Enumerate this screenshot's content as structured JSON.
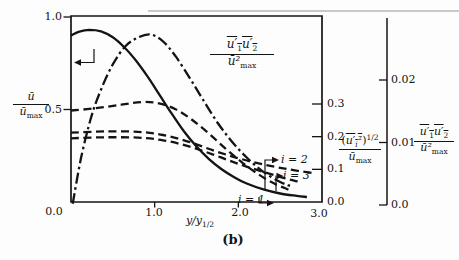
{
  "figure": {
    "caption": "(b)",
    "ink_color": "#141414",
    "background_color": "#fdfdfd",
    "artifact_rule_color": "#c9c9c9"
  },
  "chart_data": {
    "type": "line",
    "title": "",
    "grid": false,
    "x_axis": {
      "label_base": "y/y",
      "label_sub": "1/2",
      "origin_label": "0.0",
      "range": [
        0,
        3
      ],
      "ticks": [
        {
          "label": "1.0",
          "x": 1
        },
        {
          "label": "2.0",
          "x": 2
        },
        {
          "label": "3.0",
          "x": 3
        }
      ]
    },
    "left_axis": {
      "num": "ū",
      "den_base": "ū",
      "den_sub": "max",
      "range": [
        0,
        1
      ],
      "ticks": [
        {
          "label": "1.0",
          "v": 1
        },
        {
          "label": "0.5",
          "v": 0.5
        }
      ]
    },
    "inner_right_axis": {
      "num_open": "(",
      "num_base": "u′",
      "num_sub": "i",
      "num_sup": "²",
      "num_close": ")",
      "num_exp": "1/2",
      "den_base": "ū",
      "den_sub": "max",
      "range": [
        0,
        0.57
      ],
      "ticks": [
        {
          "label": "0.3",
          "v": 0.3
        },
        {
          "label": "0.2",
          "v": 0.2
        },
        {
          "label": "0.1",
          "v": 0.1
        },
        {
          "label": "0.0",
          "v": 0
        }
      ]
    },
    "outer_right_axis": {
      "num_u1": "u′",
      "num_u1_sub": "1",
      "num_u2": "u′",
      "num_u2_sub": "2",
      "den_base": "ū²",
      "den_sub": "max",
      "range": [
        0,
        0.0303
      ],
      "ticks": [
        {
          "label": "0.02",
          "v": 0.02
        },
        {
          "label": "0.01",
          "v": 0.01
        },
        {
          "label": "0.0",
          "v": 0
        }
      ]
    },
    "curve_label": {
      "num_u1": "u′",
      "num_u1_sub": "1",
      "num_u2": "u′",
      "num_u2_sub": "2",
      "den_base": "ū²",
      "den_sub": "max"
    },
    "series_labels": [
      {
        "text": "i = 2"
      },
      {
        "text": "i = 3"
      },
      {
        "text": "i = 1"
      }
    ],
    "caption": "(b)",
    "series": [
      {
        "name": "mean velocity u/u_max",
        "axis": "left",
        "style": "solid",
        "points": [
          [
            0,
            0.9
          ],
          [
            0.1,
            0.921
          ],
          [
            0.22,
            0.93
          ],
          [
            0.36,
            0.922
          ],
          [
            0.5,
            0.89
          ],
          [
            0.64,
            0.835
          ],
          [
            0.78,
            0.762
          ],
          [
            0.92,
            0.675
          ],
          [
            1.06,
            0.578
          ],
          [
            1.2,
            0.48
          ],
          [
            1.35,
            0.382
          ],
          [
            1.5,
            0.3
          ],
          [
            1.65,
            0.232
          ],
          [
            1.8,
            0.177
          ],
          [
            1.95,
            0.134
          ],
          [
            2.1,
            0.1
          ],
          [
            2.3,
            0.068
          ],
          [
            2.5,
            0.046
          ],
          [
            2.7,
            0.033
          ],
          [
            2.82,
            0.027
          ]
        ]
      },
      {
        "name": "shear stress u1u2/u_max^2",
        "axis": "outer",
        "style": "dashdot",
        "points": [
          [
            0.02,
            0.0002
          ],
          [
            0.12,
            0.0075
          ],
          [
            0.24,
            0.014
          ],
          [
            0.36,
            0.0185
          ],
          [
            0.5,
            0.0225
          ],
          [
            0.65,
            0.0254
          ],
          [
            0.8,
            0.0268
          ],
          [
            0.95,
            0.0273
          ],
          [
            1.1,
            0.0262
          ],
          [
            1.25,
            0.0238
          ],
          [
            1.42,
            0.0203
          ],
          [
            1.58,
            0.0168
          ],
          [
            1.75,
            0.0132
          ],
          [
            1.92,
            0.0102
          ],
          [
            2.1,
            0.0076
          ],
          [
            2.3,
            0.0053
          ],
          [
            2.5,
            0.0037
          ],
          [
            2.63,
            0.003
          ]
        ]
      },
      {
        "name": "turbulence intensity i=1",
        "axis": "inner",
        "style": "dashed",
        "points": [
          [
            0,
            0.28
          ],
          [
            0.3,
            0.287
          ],
          [
            0.6,
            0.298
          ],
          [
            0.85,
            0.306
          ],
          [
            1.05,
            0.302
          ],
          [
            1.25,
            0.284
          ],
          [
            1.45,
            0.251
          ],
          [
            1.65,
            0.209
          ],
          [
            1.85,
            0.163
          ],
          [
            2.05,
            0.12
          ],
          [
            2.25,
            0.083
          ],
          [
            2.45,
            0.054
          ],
          [
            2.6,
            0.038
          ]
        ]
      },
      {
        "name": "turbulence intensity i=2",
        "axis": "inner",
        "style": "dashed",
        "points": [
          [
            0,
            0.212
          ],
          [
            0.4,
            0.216
          ],
          [
            0.8,
            0.215
          ],
          [
            1.1,
            0.205
          ],
          [
            1.4,
            0.185
          ],
          [
            1.7,
            0.158
          ],
          [
            2.0,
            0.134
          ],
          [
            2.3,
            0.115
          ],
          [
            2.6,
            0.1
          ],
          [
            2.9,
            0.088
          ]
        ]
      },
      {
        "name": "turbulence intensity i=3",
        "axis": "inner",
        "style": "dashed",
        "points": [
          [
            0,
            0.195
          ],
          [
            0.4,
            0.198
          ],
          [
            0.8,
            0.197
          ],
          [
            1.1,
            0.189
          ],
          [
            1.4,
            0.171
          ],
          [
            1.7,
            0.145
          ],
          [
            2.0,
            0.117
          ],
          [
            2.3,
            0.092
          ],
          [
            2.55,
            0.073
          ],
          [
            2.72,
            0.062
          ]
        ]
      }
    ]
  }
}
